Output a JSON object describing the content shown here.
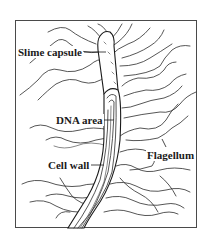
{
  "figure": {
    "colors": {
      "line": "#1a1a1a",
      "background": "#ffffff",
      "frame": "#4a4a4a"
    },
    "labels": [
      {
        "id": "slime-capsule",
        "text": "Slime capsule",
        "x": 17,
        "y": 46
      },
      {
        "id": "dna-area",
        "text": "DNA area",
        "x": 55,
        "y": 114
      },
      {
        "id": "cell-wall",
        "text": "Cell wall",
        "x": 47,
        "y": 159
      },
      {
        "id": "flagellum",
        "text": "Flagellum",
        "x": 146,
        "y": 149
      }
    ]
  }
}
